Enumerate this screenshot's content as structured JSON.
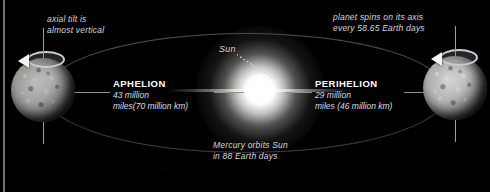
{
  "diagram": {
    "background_color": "#000000",
    "text_color": "#d7dade",
    "accent_color": "#ffffff",
    "orbit_line_color": "#b0b4ba"
  },
  "annotations": {
    "axial_tilt": "axial tilt is\nalmost vertical",
    "spin": "planet spins on its axis\nevery 58.65 Earth days",
    "orbit_period": "Mercury orbits Sun\nin 88 Earth days",
    "sun_label": "Sun"
  },
  "apsides": [
    {
      "id": "aphelion",
      "title": "APHELION",
      "distance": "43 million\nmiles(70 million km)",
      "distance_miles": "43 million miles",
      "distance_km": "70 million km"
    },
    {
      "id": "perihelion",
      "title": "PERIHELION",
      "distance": "29 million\nmiles (46 million km)",
      "distance_miles": "29 million miles",
      "distance_km": "46 million km"
    }
  ],
  "bodies": {
    "sun": "Sun",
    "planet_aphelion": "Mercury at aphelion",
    "planet_perihelion": "Mercury at perihelion"
  },
  "facts": {
    "rotation_period": "58.65 Earth days",
    "orbital_period": "88 Earth days"
  }
}
